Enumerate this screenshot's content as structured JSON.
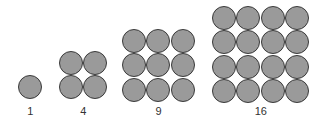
{
  "diagram": {
    "colors": {
      "fill": "#9a9a9a",
      "stroke": "#3a3a3a",
      "text": "#333333"
    },
    "groups": [
      {
        "label": "1",
        "side": 1,
        "left": 18,
        "top": 75
      },
      {
        "label": "4",
        "side": 2,
        "left": 59,
        "top": 51
      },
      {
        "label": "9",
        "side": 3,
        "left": 122,
        "top": 29
      },
      {
        "label": "16",
        "side": 4,
        "left": 212,
        "top": 6
      }
    ]
  }
}
